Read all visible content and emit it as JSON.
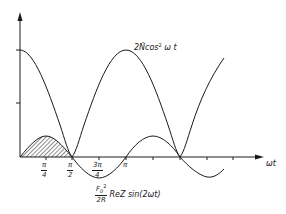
{
  "diagram": {
    "axes": {
      "x_label": "ωt",
      "y_label": ""
    },
    "x_ticks": [
      {
        "num": "π",
        "den": "4"
      },
      {
        "num": "π",
        "den": "2"
      },
      {
        "num": "3π",
        "den": "4"
      },
      {
        "single": "π"
      }
    ],
    "curves": {
      "cos_label_prefix": "2",
      "cos_label_n": "N̄",
      "cos_label_func": "cos",
      "cos_label_exp": "2",
      "cos_label_arg": " ω t",
      "sin_label_frac_num": "F",
      "sin_label_frac_sub": "0",
      "sin_label_frac_exp": "2",
      "sin_label_frac_den": "2R",
      "sin_label_rest": "ReZ  sin(2ωt)"
    },
    "shaded_region": "hatched area under sin(2ωt) between 0 and π/2"
  },
  "colors": {
    "ink": "#1a1a1a",
    "background": "#ffffff"
  }
}
